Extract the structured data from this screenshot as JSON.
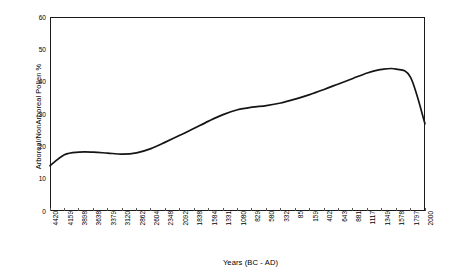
{
  "chart_data": {
    "type": "line",
    "title": "",
    "xlabel": "Years (BC - AD)",
    "ylabel": "Arboreal/NonArboreal Pollen %",
    "ylim": [
      0,
      60
    ],
    "yticks": [
      0,
      10,
      20,
      30,
      40,
      50,
      60
    ],
    "grid": false,
    "legend": "none",
    "line_color": "#151515",
    "categories": [
      "4420",
      "4159",
      "3898",
      "3638",
      "3379",
      "3120",
      "2862",
      "2604",
      "2348",
      "2092",
      "1838",
      "1584",
      "1331",
      "1080",
      "829",
      "580",
      "332",
      "85",
      "159",
      "402",
      "643",
      "881",
      "1117",
      "1349",
      "1578",
      "1797",
      "2000"
    ],
    "x": [
      4420,
      4159,
      3898,
      3638,
      3379,
      3120,
      2862,
      2604,
      2348,
      2092,
      1838,
      1584,
      1331,
      1080,
      829,
      580,
      332,
      85,
      159,
      402,
      643,
      881,
      1117,
      1349,
      1578,
      1797,
      2000
    ],
    "values": [
      14.0,
      17.4,
      18.2,
      18.2,
      17.9,
      17.6,
      18.0,
      19.3,
      21.3,
      23.4,
      25.6,
      27.8,
      29.8,
      31.3,
      32.1,
      32.6,
      33.4,
      34.6,
      36.0,
      37.6,
      39.3,
      41.0,
      42.7,
      43.8,
      43.9,
      41.3,
      27.0
    ]
  },
  "axes": {
    "ylabel": "Arboreal/NonArboreal Pollen %",
    "xlabel": "Years (BC - AD)",
    "yticks": [
      "0",
      "10",
      "20",
      "30",
      "40",
      "50",
      "60"
    ],
    "xticks": [
      "4420",
      "4159",
      "3898",
      "3638",
      "3379",
      "3120",
      "2862",
      "2604",
      "2348",
      "2092",
      "1838",
      "1584",
      "1331",
      "1080",
      "829",
      "580",
      "332",
      "85",
      "159",
      "402",
      "643",
      "881",
      "1117",
      "1349",
      "1578",
      "1797",
      "2000"
    ]
  },
  "colors": {
    "line": "#151515",
    "frame": "#1a1a1a",
    "background": "#ffffff",
    "text": "#000000"
  }
}
